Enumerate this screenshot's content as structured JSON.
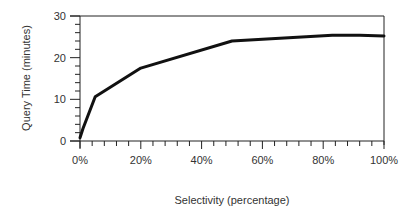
{
  "chart_data": {
    "type": "line",
    "title": "",
    "xlabel": "Selectivity (percentage)",
    "ylabel": "Query Time (minutes)",
    "xlim": [
      0,
      100
    ],
    "ylim": [
      0,
      30
    ],
    "x_ticks": [
      "0%",
      "20%",
      "40%",
      "60%",
      "80%",
      "100%"
    ],
    "x_tick_values": [
      0,
      20,
      40,
      60,
      80,
      100
    ],
    "y_ticks": [
      "0",
      "10",
      "20",
      "30"
    ],
    "y_tick_values": [
      0,
      10,
      20,
      30
    ],
    "grid": false,
    "legend": "none",
    "series": [
      {
        "name": "Query Time",
        "x": [
          0,
          1,
          5,
          20,
          50,
          83,
          92,
          100
        ],
        "values": [
          0.8,
          3,
          10.6,
          17.5,
          24,
          25.4,
          25.4,
          25.2
        ]
      }
    ]
  },
  "colors": {
    "line": "#111111",
    "axis": "#222222",
    "background": "#ffffff"
  }
}
